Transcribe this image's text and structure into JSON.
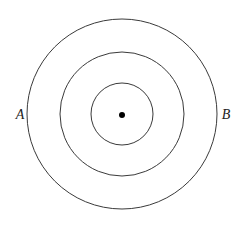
{
  "diagram": {
    "type": "concentric-circles",
    "center": {
      "x": 122,
      "y": 114
    },
    "circles": [
      {
        "name": "outer",
        "r": 95
      },
      {
        "name": "middle",
        "r": 62
      },
      {
        "name": "inner",
        "r": 31
      }
    ],
    "center_dot_r": 3,
    "labels": [
      {
        "text": "A",
        "x": 20,
        "y": 119
      },
      {
        "text": "B",
        "x": 226,
        "y": 119
      }
    ],
    "colors": {
      "stroke": "#3a3a3a",
      "dot": "#000000",
      "background": "#ffffff"
    }
  }
}
